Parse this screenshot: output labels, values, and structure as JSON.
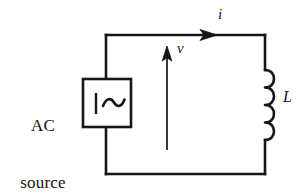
{
  "figure": {
    "kind": "circuit-diagram",
    "background_color": "#ffffff",
    "line_color": "#161616"
  },
  "labels": {
    "ac_source_line1": "AC",
    "ac_source_line2": "source",
    "current": "i",
    "voltage": "v",
    "inductor": "L"
  },
  "components": {
    "source": {
      "name": "ac-source",
      "symbol": "bar-and-sine-wave",
      "box": {
        "x": 83,
        "y": 79,
        "width": 48,
        "height": 48
      }
    },
    "inductor": {
      "name": "inductor",
      "symbol": "four-coil-bumps",
      "coil_count": 4,
      "top_y": 70,
      "bottom_y": 140,
      "wire_x": 265
    }
  },
  "wires": {
    "loop": {
      "left_x": 106,
      "right_x": 265,
      "top_y": 35,
      "bottom_y": 174
    },
    "stroke_width": 2.6
  },
  "arrows": {
    "current": {
      "name": "current-arrow",
      "direction": "right",
      "on_wire": "top",
      "tip_x": 216,
      "y": 35
    },
    "voltage": {
      "name": "voltage-arrow",
      "direction": "up",
      "x": 167,
      "tip_y": 48,
      "tail_y": 150
    }
  }
}
